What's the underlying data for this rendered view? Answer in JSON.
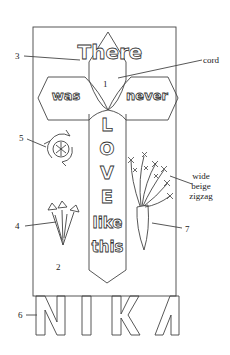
{
  "diagram": {
    "type": "banner-pattern",
    "banner_text": {
      "line1": "There",
      "line2_left": "was",
      "line2_right": "never",
      "vertical": [
        "L",
        "O",
        "V",
        "E"
      ],
      "line4": "like",
      "line5": "this",
      "bottom": [
        "N",
        "I",
        "K",
        "A"
      ]
    },
    "labels": {
      "label_1": "1",
      "label_2": "2",
      "label_3": "3",
      "label_4": "4",
      "label_5": "5",
      "label_6": "6",
      "label_7": "7",
      "cord": "cord",
      "zigzag": "wide beige zigzag"
    },
    "colors": {
      "line": "#333333",
      "background": "#ffffff"
    }
  }
}
